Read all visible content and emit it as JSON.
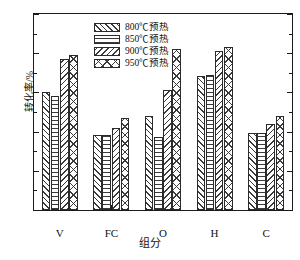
{
  "chart_data": {
    "type": "bar",
    "title": "",
    "xlabel": "组分",
    "ylabel": "转化率/%",
    "ylim": [
      0,
      100
    ],
    "ytick_step": 20,
    "yticks": [
      0,
      20,
      40,
      60,
      80,
      100
    ],
    "minor_ytick_step": 10,
    "grid": false,
    "legend_position": "upper left inside",
    "categories": [
      "V",
      "FC",
      "O",
      "H",
      "C"
    ],
    "series": [
      {
        "name": "800℃预热",
        "pattern": "diagonal-forward-hatch",
        "values": [
          60,
          38.5,
          48,
          68.5,
          39.5
        ]
      },
      {
        "name": "850℃预热",
        "pattern": "horizontal-lines",
        "values": [
          58,
          38.5,
          37,
          69,
          39.5
        ]
      },
      {
        "name": "900℃预热",
        "pattern": "diagonal-backward-hatch",
        "values": [
          77,
          42,
          61,
          81,
          44
        ]
      },
      {
        "name": "950℃预热",
        "pattern": "cross-diagonal-hatch",
        "values": [
          79,
          47,
          82,
          83,
          48
        ]
      }
    ]
  },
  "axis": {
    "y_title": "转化率/%",
    "x_title": "组分",
    "y_tick_labels": [
      "0",
      "20",
      "40",
      "60",
      "80",
      "100"
    ],
    "x_tick_labels": [
      "V",
      "FC",
      "O",
      "H",
      "C"
    ]
  }
}
